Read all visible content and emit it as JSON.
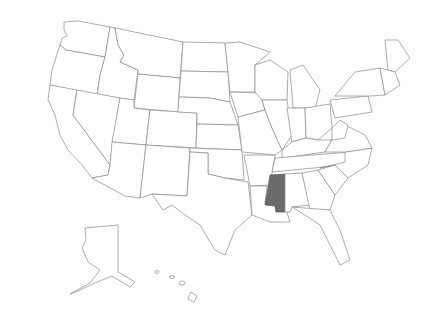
{
  "map": {
    "title": "United States",
    "highlighted_state": "Mississippi",
    "highlight_color": "#6b6b6b",
    "base_fill": "#ffffff",
    "border_color": "#8a8a8a"
  }
}
